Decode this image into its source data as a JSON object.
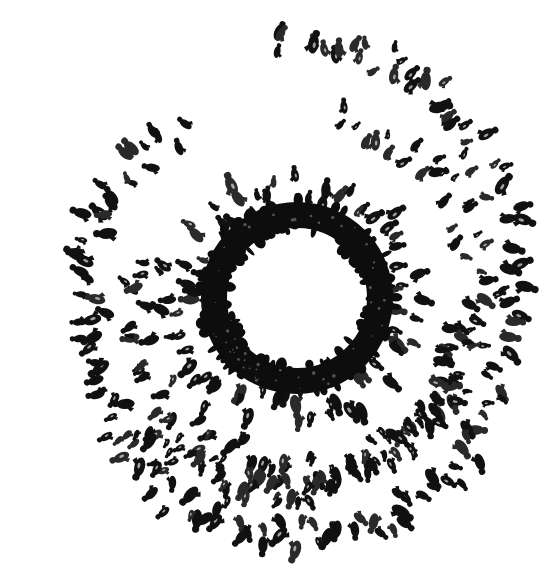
{
  "canvas": {
    "width": 556,
    "height": 583,
    "background": "#ffffff",
    "ink": "#111111",
    "ink_mid": "#2a2a2a"
  },
  "artwork": {
    "description": "Ink drawing of a spiral of small dark figures converging toward a thick black ring",
    "ring": {
      "cx": 297,
      "cy": 298,
      "outer_r": 96,
      "inner_r": 70,
      "color": "#0d0d0d"
    },
    "inner_halo": {
      "count": 70,
      "r_min": 96,
      "r_max": 132,
      "size_min": 5,
      "size_max": 10
    },
    "spiral_arms": [
      {
        "name": "outer-arm",
        "cx": 290,
        "cy": 300,
        "a_start_deg": -95,
        "a_end_deg": 235,
        "r_start": 250,
        "r_end": 205,
        "count": 150,
        "jitter": 16,
        "size_min": 5,
        "size_max": 10,
        "sx": 0.96,
        "sy": 1.05
      },
      {
        "name": "middle-arm",
        "cx": 300,
        "cy": 305,
        "a_start_deg": -80,
        "a_end_deg": 200,
        "r_start": 185,
        "r_end": 150,
        "count": 95,
        "jitter": 18,
        "size_min": 4,
        "size_max": 9,
        "sx": 1.02,
        "sy": 1.0
      },
      {
        "name": "lower-band",
        "cx": 300,
        "cy": 300,
        "a_start_deg": 10,
        "a_end_deg": 140,
        "r_start": 160,
        "r_end": 200,
        "count": 80,
        "jitter": 14,
        "size_min": 4,
        "size_max": 9,
        "sx": 1.0,
        "sy": 1.0
      }
    ],
    "seed": 7
  }
}
